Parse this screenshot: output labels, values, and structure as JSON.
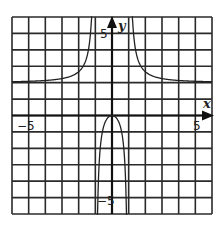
{
  "chart_data": {
    "type": "line",
    "title": "",
    "xlabel": "x",
    "ylabel": "y",
    "xlim": [
      -6,
      6
    ],
    "ylim": [
      -6,
      6
    ],
    "grid": true,
    "grid_step": 1,
    "tick_labels": {
      "x": [
        {
          "value": -5,
          "label": "−5"
        },
        {
          "value": 5,
          "label": "5"
        }
      ],
      "y": [
        {
          "value": 5,
          "label": "5"
        },
        {
          "value": -5,
          "label": "−5"
        }
      ]
    },
    "asymptotes": {
      "vertical": [
        -1,
        1
      ],
      "horizontal": [
        2
      ]
    },
    "series": [
      {
        "name": "left branch",
        "points": [
          [
            -6,
            2.06
          ],
          [
            -5,
            2.08
          ],
          [
            -4,
            2.13
          ],
          [
            -3,
            2.25
          ],
          [
            -2,
            2.67
          ],
          [
            -1.5,
            3.6
          ],
          [
            -1.3,
            4.9
          ],
          [
            -1.2,
            6.0
          ]
        ]
      },
      {
        "name": "middle branch",
        "points": [
          [
            -0.92,
            -6.0
          ],
          [
            -0.8,
            -3.56
          ],
          [
            -0.6,
            -1.13
          ],
          [
            -0.4,
            -0.38
          ],
          [
            -0.2,
            -0.08
          ],
          [
            0,
            0
          ],
          [
            0.2,
            -0.08
          ],
          [
            0.4,
            -0.38
          ],
          [
            0.6,
            -1.13
          ],
          [
            0.8,
            -3.56
          ],
          [
            0.92,
            -6.0
          ]
        ]
      },
      {
        "name": "right branch",
        "points": [
          [
            1.2,
            6.0
          ],
          [
            1.3,
            4.9
          ],
          [
            1.5,
            3.6
          ],
          [
            2,
            2.67
          ],
          [
            3,
            2.25
          ],
          [
            4,
            2.13
          ],
          [
            5,
            2.08
          ],
          [
            6,
            2.06
          ]
        ]
      }
    ],
    "legend": null
  },
  "labels": {
    "x_axis": "x",
    "y_axis": "y",
    "x_min_tick": "−5",
    "x_max_tick": "5",
    "y_max_tick": "5",
    "y_min_tick": "−5"
  }
}
